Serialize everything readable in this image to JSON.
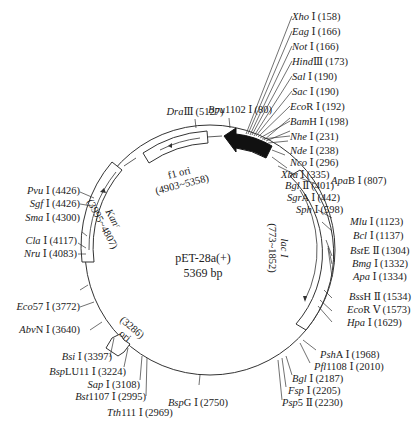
{
  "plasmid": {
    "name": "pET-28a(+)",
    "size_label": "5369 bp",
    "length": 5369
  },
  "features": [
    {
      "name": "lac I",
      "range": "(773~1852)",
      "start": 773,
      "end": 1852,
      "direction": "cw",
      "style": "open-box"
    },
    {
      "name": "Kanʳ",
      "range": "(3995~4807)",
      "start": 3995,
      "end": 4807,
      "direction": "ccw",
      "style": "open-box"
    },
    {
      "name": "f1 ori",
      "range": "(4903~5358)",
      "start": 4903,
      "end": 5358,
      "direction": "ccw",
      "style": "open-box"
    },
    {
      "name": "ori",
      "range": "(3286)",
      "start": 3286,
      "direction": "ccw",
      "style": "open-arrow"
    },
    {
      "name": "MCS / T7 region",
      "start": 80,
      "end": 420,
      "direction": "ccw",
      "style": "filled-arrow"
    }
  ],
  "sites": [
    {
      "it": "Xho",
      "suffix": " Ⅰ",
      "pos": "(158)"
    },
    {
      "it": "Eag",
      "suffix": " Ⅰ",
      "pos": "(166)"
    },
    {
      "it": "Not",
      "suffix": " Ⅰ",
      "pos": "(166)"
    },
    {
      "it": "Hind",
      "suffix": "Ⅲ",
      "pos": "(173)"
    },
    {
      "it": "Sal",
      "suffix": " Ⅰ",
      "pos": "(190)"
    },
    {
      "it": "Sac",
      "suffix": " Ⅰ",
      "pos": "(190)"
    },
    {
      "it": "Eco",
      "suffix": "R Ⅰ",
      "pos": "(192)"
    },
    {
      "it": "Bam",
      "suffix": "H Ⅰ",
      "pos": "(198)"
    },
    {
      "it": "Nhe",
      "suffix": " Ⅰ",
      "pos": "(231)"
    },
    {
      "it": "Nde",
      "suffix": " Ⅰ",
      "pos": "(238)"
    },
    {
      "it": "Nco",
      "suffix": " Ⅰ",
      "pos": "(296)"
    },
    {
      "it": "Xba",
      "suffix": " Ⅰ",
      "pos": "(335)"
    },
    {
      "it": "Bgl",
      "suffix": " Ⅱ",
      "pos": "(401)"
    },
    {
      "it": "Sgr",
      "suffix": "A Ⅰ",
      "pos": "(442)"
    },
    {
      "it": "Sph",
      "suffix": " Ⅰ",
      "pos": "(598)"
    },
    {
      "it": "Apa",
      "suffix": "B Ⅰ",
      "pos": "(807)"
    },
    {
      "it": "Mlu",
      "suffix": " Ⅰ",
      "pos": "(1123)"
    },
    {
      "it": "Bcl",
      "suffix": " Ⅰ",
      "pos": "(1137)"
    },
    {
      "it": "Bst",
      "suffix": "E Ⅱ",
      "pos": "(1304)"
    },
    {
      "it": "Bmg",
      "suffix": " Ⅰ",
      "pos": "(1332)"
    },
    {
      "it": "Apa",
      "suffix": " Ⅰ",
      "pos": "(1334)"
    },
    {
      "it": "Bss",
      "suffix": "H Ⅱ",
      "pos": "(1534)"
    },
    {
      "it": "Eco",
      "suffix": "R Ⅴ",
      "pos": "(1573)"
    },
    {
      "it": "Hpa",
      "suffix": " Ⅰ",
      "pos": "(1629)"
    },
    {
      "it": "Psh",
      "suffix": "A Ⅰ",
      "pos": "(1968)"
    },
    {
      "it": "Pfl",
      "suffix": "1108 Ⅰ",
      "pos": "(2010)"
    },
    {
      "it": "Bgl",
      "suffix": " Ⅰ",
      "pos": "(2187)"
    },
    {
      "it": "Fsp",
      "suffix": " Ⅰ",
      "pos": "(2205)"
    },
    {
      "it": "Psp",
      "suffix": "5 Ⅱ",
      "pos": "(2230)"
    },
    {
      "it": "Bsp",
      "suffix": "G Ⅰ",
      "pos": "(2750)"
    },
    {
      "it": "Tth",
      "suffix": "111 Ⅰ",
      "pos": "(2969)"
    },
    {
      "it": "Bst",
      "suffix": "1107 Ⅰ",
      "pos": "(2995)"
    },
    {
      "it": "Sap",
      "suffix": " Ⅰ",
      "pos": "(3108)"
    },
    {
      "it": "Bsp",
      "suffix": "LU11 Ⅰ",
      "pos": "(3224)"
    },
    {
      "it": "Bsi",
      "suffix": " Ⅰ",
      "pos": "(3397)"
    },
    {
      "it": "Abv",
      "suffix": "N Ⅰ",
      "pos": "(3640)"
    },
    {
      "it": "Eco",
      "suffix": "57 Ⅰ",
      "pos": "(3772)"
    },
    {
      "it": "Nru",
      "suffix": " Ⅰ",
      "pos": "(4083)"
    },
    {
      "it": "Cla",
      "suffix": " Ⅰ",
      "pos": "(4117)"
    },
    {
      "it": "Sma",
      "suffix": " Ⅰ",
      "pos": "(4300)"
    },
    {
      "it": "Sgf",
      "suffix": " Ⅰ",
      "pos": "(4426)"
    },
    {
      "it": "Pvu",
      "suffix": " Ⅰ",
      "pos": "(4426)"
    },
    {
      "it": "Dra",
      "suffix": "Ⅲ",
      "pos": "(5127)"
    },
    {
      "it": "Bpu",
      "suffix": "1102 Ⅰ",
      "pos": "(80)"
    }
  ]
}
